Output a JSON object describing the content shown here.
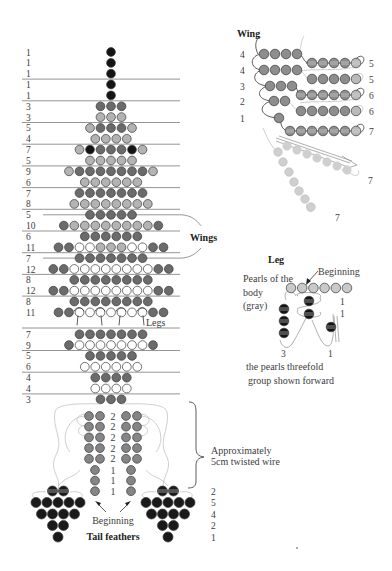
{
  "colors": {
    "K": "#141414",
    "D": "#6b6b6b",
    "L": "#b3b3b3",
    "W": "#ffffff",
    "T": "#858585",
    "F": "#1a1a1a",
    "G": "#c9c9c9",
    "WingBead": "#8d8d8d",
    "WingTip": "#b9b9b9",
    "Faint": "#cfcfcf"
  },
  "body": {
    "rows": [
      {
        "count": "1",
        "beads": "K"
      },
      {
        "count": "1",
        "beads": "K"
      },
      {
        "count": "1",
        "beads": "K"
      },
      {
        "count": "1",
        "beads": "K"
      },
      {
        "count": "1",
        "beads": "K"
      },
      {
        "count": "3",
        "beads": "DDD"
      },
      {
        "count": "3",
        "beads": "LLL"
      },
      {
        "count": "5",
        "beads": "LDDDL"
      },
      {
        "count": "4",
        "beads": "LLLL"
      },
      {
        "count": "7",
        "beads": "LKDDDKL"
      },
      {
        "count": "5",
        "beads": "LLLLL"
      },
      {
        "count": "9",
        "beads": "LDDDDDDDL"
      },
      {
        "count": "6",
        "beads": "LLLLLL"
      },
      {
        "count": "7",
        "beads": "DDDDDDD"
      },
      {
        "count": "8",
        "beads": "LLLLLLLL"
      },
      {
        "count": "5",
        "beads": "DDDDD"
      },
      {
        "count": "10",
        "beads": "DLLLLLLLLD"
      },
      {
        "count": "6",
        "beads": "DDDDDD"
      },
      {
        "count": "11",
        "beads": "DDWWLLLWWDD"
      },
      {
        "count": "7",
        "beads": "DDDDDDD"
      },
      {
        "count": "12",
        "beads": "DDWWWWWWWWDD"
      },
      {
        "count": "8",
        "beads": "DDDDDDDD"
      },
      {
        "count": "12",
        "beads": "DDWWWWWWWWDD"
      },
      {
        "count": "8",
        "beads": "DDDDDDDD"
      },
      {
        "count": "11",
        "beads": "DDWWWWWWWDD"
      },
      {
        "count": "7",
        "beads": "DDDDDDD"
      },
      {
        "count": "9",
        "beads": "DWWWWWWWD"
      },
      {
        "count": "5",
        "beads": "DDDDD"
      },
      {
        "count": "6",
        "beads": "WWWWWW"
      },
      {
        "count": "4",
        "beads": "DDDD"
      },
      {
        "count": "4",
        "beads": "WWWW"
      },
      {
        "count": "3",
        "beads": "DDD"
      }
    ],
    "divider_after_rows": [
      2,
      4,
      6,
      8,
      10,
      12,
      14,
      16,
      18,
      20,
      22,
      24,
      26,
      28,
      30
    ],
    "wing_rows": [
      15,
      19
    ],
    "wings_label": "Wings",
    "legs_label": "Legs"
  },
  "tail": {
    "pair_rows": [
      "2",
      "2",
      "2",
      "2",
      "2"
    ],
    "single_rows": [
      "1",
      "1",
      "1"
    ],
    "beginning_label": "Beginning",
    "wire_note": [
      "Approximately",
      "5cm twisted wire"
    ],
    "feather_rows": [
      2,
      5,
      4,
      2,
      1
    ],
    "feather_counts": [
      "2",
      "5",
      "4",
      "2",
      "1"
    ],
    "feathers_label": "Tail feathers"
  },
  "wing_diagram": {
    "title": "Wing",
    "left_rows": [
      {
        "label": "4",
        "count": 4
      },
      {
        "label": "4",
        "count": 4
      },
      {
        "label": "3",
        "count": 3
      },
      {
        "label": "2",
        "count": 2
      },
      {
        "label": "1",
        "count": 1
      }
    ],
    "right_rows": [
      {
        "label": "5",
        "count": 5
      },
      {
        "label": "5",
        "count": 5
      },
      {
        "label": "6",
        "count": 6
      },
      {
        "label": "6",
        "count": 6
      },
      {
        "label": "7",
        "count": 7
      }
    ],
    "strand_labels": [
      "7",
      "7"
    ]
  },
  "leg_diagram": {
    "title": "Leg",
    "beginning_label": "Beginning",
    "body_pearls_note": [
      "Pearls of the",
      "body",
      "(gray)"
    ],
    "body_pearl_count": 6,
    "row_labels": [
      "1",
      "1"
    ],
    "bottom_labels": [
      "3",
      "1"
    ],
    "caption": [
      "the pearls threefold",
      "group shown forward"
    ]
  }
}
